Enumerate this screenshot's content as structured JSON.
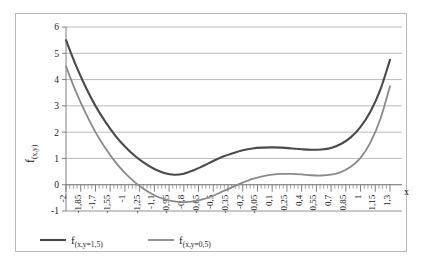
{
  "chart_data": {
    "type": "line",
    "title": "",
    "xlabel": "x",
    "ylabel": "f(x,y)",
    "xlim": [
      -2,
      1.3
    ],
    "ylim": [
      -1,
      6
    ],
    "grid": true,
    "legend_position": "bottom",
    "x_tick_labels": [
      "-2",
      "-1,85",
      "-1,7",
      "-1,55",
      "-1",
      "-1,25",
      "-1,1",
      "-0,95",
      "-0,8",
      "-0,65",
      "-0,5",
      "-0,35",
      "-0,2",
      "-0,05",
      "0,1",
      "0,25",
      "0,4",
      "0,55",
      "0,7",
      "0,85",
      "1",
      "1,15",
      "1,3"
    ],
    "y_tick_labels": [
      "-1",
      "0",
      "1",
      "2",
      "3",
      "4",
      "5",
      "6"
    ],
    "y_ticks": [
      -1,
      0,
      1,
      2,
      3,
      4,
      5,
      6
    ],
    "x": [
      -2,
      -1.9,
      -1.8,
      -1.7,
      -1.6,
      -1.5,
      -1.4,
      -1.3,
      -1.2,
      -1.1,
      -1.0,
      -0.9,
      -0.8,
      -0.7,
      -0.6,
      -0.5,
      -0.4,
      -0.3,
      -0.2,
      -0.1,
      0,
      0.1,
      0.2,
      0.3,
      0.4,
      0.5,
      0.6,
      0.7,
      0.8,
      0.9,
      1.0,
      1.1,
      1.2,
      1.3
    ],
    "series": [
      {
        "name": "f(x,y=1,5)",
        "color": "#4a4a4a",
        "width": 2.1,
        "values": [
          5.5,
          4.55,
          3.72,
          3.0,
          2.4,
          1.88,
          1.45,
          1.1,
          0.82,
          0.6,
          0.45,
          0.38,
          0.42,
          0.55,
          0.72,
          0.9,
          1.07,
          1.2,
          1.31,
          1.38,
          1.41,
          1.42,
          1.41,
          1.38,
          1.35,
          1.33,
          1.34,
          1.4,
          1.55,
          1.8,
          2.2,
          2.78,
          3.6,
          4.75
        ]
      },
      {
        "name": "f(x,y=0,5)",
        "color": "#8a8a8a",
        "width": 1.8,
        "values": [
          4.5,
          3.55,
          2.72,
          2.0,
          1.4,
          0.88,
          0.45,
          0.1,
          -0.18,
          -0.4,
          -0.55,
          -0.63,
          -0.66,
          -0.63,
          -0.55,
          -0.42,
          -0.25,
          -0.08,
          0.08,
          0.22,
          0.32,
          0.38,
          0.41,
          0.41,
          0.39,
          0.36,
          0.35,
          0.38,
          0.48,
          0.68,
          1.02,
          1.6,
          2.48,
          3.75
        ]
      }
    ]
  },
  "legend": {
    "entries": [
      {
        "label_base": "f",
        "label_sub": "(x,y=1,5)"
      },
      {
        "label_base": "f",
        "label_sub": "(x,y=0,5)"
      }
    ]
  },
  "axes": {
    "y_axis_label_base": "f",
    "y_axis_label_sub": "(x,y)",
    "x_axis_label": "x"
  },
  "colors": {
    "series_dark": "#4a4a4a",
    "series_light": "#8a8a8a",
    "gridline": "#a9a9a9",
    "axis": "#808080",
    "frame": "#b8b8b8",
    "text": "#1a1a1a"
  }
}
